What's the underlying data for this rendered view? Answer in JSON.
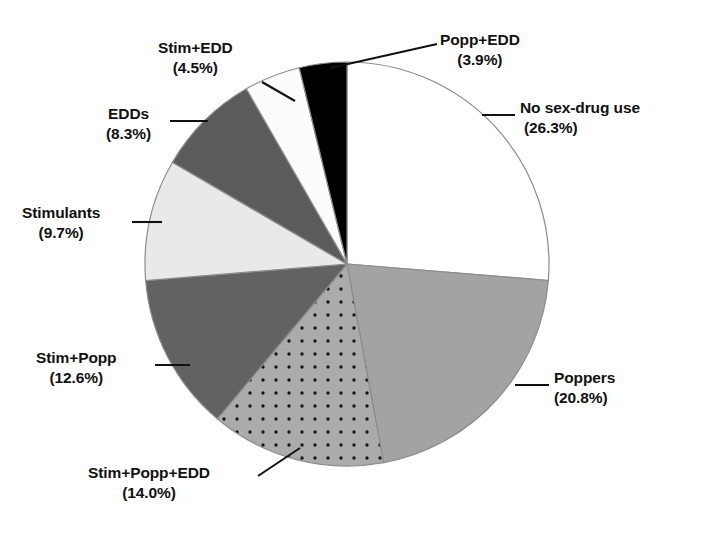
{
  "chart_data": {
    "type": "pie",
    "title": "",
    "subtitle": "",
    "xlabel": "",
    "ylabel": "",
    "legend_position": "callout-labels",
    "grid": false,
    "units": "percent",
    "total": 100.1,
    "categories": [
      "No sex-drug use",
      "Poppers",
      "Stim+Popp+EDD",
      "Stim+Popp",
      "Stimulants",
      "EDDs",
      "Stim+EDD",
      "Popp+EDD"
    ],
    "values": [
      26.3,
      20.8,
      14.0,
      12.6,
      9.7,
      8.3,
      4.5,
      3.9
    ],
    "slices": [
      {
        "label": "No sex-drug use",
        "value": 26.3,
        "value_text": "(26.3%)",
        "fill": "#ffffff",
        "pattern": "solid",
        "start_angle_deg": 0.0,
        "end_angle_deg": 94.68
      },
      {
        "label": "Poppers",
        "value": 20.8,
        "value_text": "(20.8%)",
        "fill": "#a3a3a3",
        "pattern": "solid",
        "start_angle_deg": 94.68,
        "end_angle_deg": 169.56
      },
      {
        "label": "Stim+Popp+EDD",
        "value": 14.0,
        "value_text": "(14.0%)",
        "fill": "#ababab",
        "pattern": "dots",
        "start_angle_deg": 169.56,
        "end_angle_deg": 219.96
      },
      {
        "label": "Stim+Popp",
        "value": 12.6,
        "value_text": "(12.6%)",
        "fill": "#626262",
        "pattern": "solid",
        "start_angle_deg": 219.96,
        "end_angle_deg": 265.32
      },
      {
        "label": "Stimulants",
        "value": 9.7,
        "value_text": "(9.7%)",
        "fill": "#e9e9e9",
        "pattern": "solid",
        "start_angle_deg": 265.32,
        "end_angle_deg": 300.24
      },
      {
        "label": "EDDs",
        "value": 8.3,
        "value_text": "(8.3%)",
        "fill": "#5b5b5b",
        "pattern": "solid",
        "start_angle_deg": 300.24,
        "end_angle_deg": 330.12
      },
      {
        "label": "Stim+EDD",
        "value": 4.5,
        "value_text": "(4.5%)",
        "fill": "#fcfcfc",
        "pattern": "solid",
        "start_angle_deg": 330.12,
        "end_angle_deg": 346.32
      },
      {
        "label": "Popp+EDD",
        "value": 3.9,
        "value_text": "(3.9%)",
        "fill": "#000000",
        "pattern": "solid",
        "start_angle_deg": 346.32,
        "end_angle_deg": 360.0
      }
    ]
  },
  "labels": {
    "popp_edd": {
      "name": "Popp+EDD",
      "pct": "(3.9%)"
    },
    "no_sex_drug": {
      "name": "No sex-drug use",
      "pct": "(26.3%)"
    },
    "stim_edd": {
      "name": "Stim+EDD",
      "pct": "(4.5%)"
    },
    "edds": {
      "name": "EDDs",
      "pct": "(8.3%)"
    },
    "stimulants": {
      "name": "Stimulants",
      "pct": "(9.7%)"
    },
    "stim_popp": {
      "name": "Stim+Popp",
      "pct": "(12.6%)"
    },
    "stim_popp_edd": {
      "name": "Stim+Popp+EDD",
      "pct": "(14.0%)"
    },
    "poppers": {
      "name": "Poppers",
      "pct": "(20.8%)"
    }
  },
  "colors": {
    "outline": "#8c8c8c",
    "leader_line": "#111111",
    "text": "#111111",
    "background": "#ffffff"
  }
}
